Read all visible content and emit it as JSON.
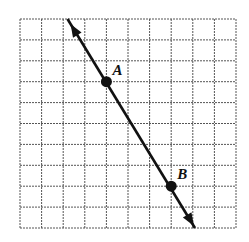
{
  "diagram": {
    "type": "coordinate-grid-line",
    "grid": {
      "columns": 10,
      "rows": 10,
      "left": 20,
      "top": 19,
      "right": 236,
      "bottom": 228
    },
    "line": {
      "description": "line through A and B with arrows at both ends",
      "start": [
        2.2,
        10
      ],
      "end": [
        8.1,
        0
      ]
    },
    "points": [
      {
        "label": "A",
        "x": 4,
        "y": 7
      },
      {
        "label": "B",
        "x": 7,
        "y": 2
      }
    ],
    "colors": {
      "line": "#111111",
      "grid": "#555555",
      "background": "#ffffff"
    }
  }
}
